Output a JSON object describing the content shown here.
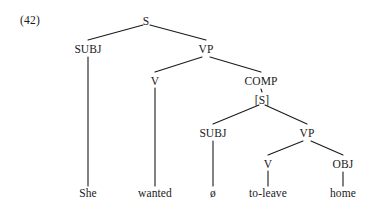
{
  "figure": {
    "example_number": "(42)",
    "sentence": "She wanted ø to-leave home",
    "colors": {
      "background": "#ffffff",
      "ink": "#1a1a1a",
      "line": "#1a1a1a"
    }
  },
  "nodes": {
    "s_root": {
      "label": "S",
      "x": 146,
      "y": 22
    },
    "subj_matrix": {
      "label": "SUBJ",
      "x": 88,
      "y": 50
    },
    "vp_matrix": {
      "label": "VP",
      "x": 206,
      "y": 50
    },
    "v_matrix": {
      "label": "V",
      "x": 155,
      "y": 82
    },
    "comp": {
      "label": "COMP",
      "x": 261,
      "y": 82
    },
    "s_embedded": {
      "label": "[S]",
      "x": 262,
      "y": 101
    },
    "subj_embedded": {
      "label": "SUBJ",
      "x": 213,
      "y": 134
    },
    "vp_embedded": {
      "label": "VP",
      "x": 307,
      "y": 134
    },
    "v_embedded": {
      "label": "V",
      "x": 268,
      "y": 165
    },
    "obj": {
      "label": "OBJ",
      "x": 343,
      "y": 165
    }
  },
  "leaves": {
    "she": {
      "label": "She",
      "x": 88,
      "y": 194
    },
    "wanted": {
      "label": "wanted",
      "x": 155,
      "y": 194
    },
    "null_subject": {
      "label": "ø",
      "x": 213,
      "y": 194
    },
    "to_leave": {
      "label": "to-leave",
      "x": 268,
      "y": 194
    },
    "home": {
      "label": "home",
      "x": 343,
      "y": 194
    }
  },
  "edges": [
    {
      "from": "s_root",
      "to": "subj_matrix",
      "x1": 143,
      "y1": 25,
      "x2": 88,
      "y2": 40
    },
    {
      "from": "s_root",
      "to": "vp_matrix",
      "x1": 150,
      "y1": 25,
      "x2": 206,
      "y2": 40
    },
    {
      "from": "subj_matrix",
      "to": "she",
      "x1": 88,
      "y1": 57,
      "x2": 88,
      "y2": 186
    },
    {
      "from": "vp_matrix",
      "to": "v_matrix",
      "x1": 202,
      "y1": 57,
      "x2": 155,
      "y2": 72
    },
    {
      "from": "vp_matrix",
      "to": "comp",
      "x1": 210,
      "y1": 57,
      "x2": 261,
      "y2": 72
    },
    {
      "from": "v_matrix",
      "to": "wanted",
      "x1": 155,
      "y1": 88,
      "x2": 155,
      "y2": 186
    },
    {
      "from": "comp",
      "to": "s_embedded",
      "x1": 261,
      "y1": 89,
      "x2": 262,
      "y2": 92
    },
    {
      "from": "s_embedded",
      "to": "subj_embedded",
      "x1": 259,
      "y1": 105,
      "x2": 213,
      "y2": 124
    },
    {
      "from": "s_embedded",
      "to": "vp_embedded",
      "x1": 265,
      "y1": 105,
      "x2": 307,
      "y2": 124
    },
    {
      "from": "subj_embedded",
      "to": "null_subject",
      "x1": 213,
      "y1": 141,
      "x2": 213,
      "y2": 186
    },
    {
      "from": "vp_embedded",
      "to": "v_embedded",
      "x1": 303,
      "y1": 141,
      "x2": 268,
      "y2": 155
    },
    {
      "from": "vp_embedded",
      "to": "obj",
      "x1": 311,
      "y1": 141,
      "x2": 343,
      "y2": 155
    },
    {
      "from": "v_embedded",
      "to": "to_leave",
      "x1": 268,
      "y1": 171,
      "x2": 268,
      "y2": 186
    },
    {
      "from": "obj",
      "to": "home",
      "x1": 343,
      "y1": 172,
      "x2": 343,
      "y2": 186
    }
  ]
}
